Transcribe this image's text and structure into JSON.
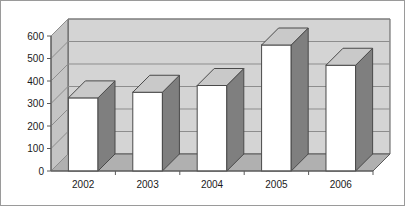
{
  "chart_data": {
    "type": "bar",
    "title": "",
    "subtitle": "",
    "xlabel": "",
    "ylabel": "",
    "categories": [
      "2002",
      "2003",
      "2004",
      "2005",
      "2006"
    ],
    "values": [
      325,
      350,
      380,
      560,
      470
    ],
    "series": [
      {
        "name": "Series 1",
        "values": [
          325,
          350,
          380,
          560,
          470
        ]
      }
    ],
    "ylim": [
      0,
      600
    ],
    "xlim": null,
    "ytick_labels": [
      "0",
      "100",
      "200",
      "300",
      "400",
      "500",
      "600"
    ],
    "ytick_values": [
      0,
      100,
      200,
      300,
      400,
      500,
      600
    ],
    "xtick_labels": [
      "2002",
      "2003",
      "2004",
      "2005",
      "2006"
    ],
    "grid": true,
    "grid_axis": "y",
    "legend": false,
    "legend_position": "none",
    "three_d": true,
    "annotations": [],
    "data_labels": false
  },
  "style": {
    "plot_background": "#d4d4d4",
    "floor_color": "#b0b0b0",
    "side_wall_color": "#c4c4c4",
    "bar_face_color": "#ffffff",
    "bar_side_color": "#7f7f7f",
    "bar_top_color": "#c9c9c9",
    "bar_outline_color": "#4a4a4a",
    "gridline_color": "#8d8d8d",
    "axis_color": "#5a5a5a",
    "text_color": "#1a1a1a",
    "page_background": "#ffffff",
    "border_color": "#9a9a9a"
  }
}
